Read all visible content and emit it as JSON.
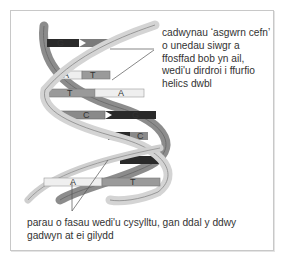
{
  "diagram": {
    "labels": {
      "backbone": "cadwynau ‘asgwrn cefn’ o unedau siwgr a ffosffad bob yn ail, wedi'u dirdroi i ffurfio helics dwbl",
      "base_pairs": "parau o fasau wedi'u cysylltu, gan ddal y ddwy gadwyn at ei gilydd"
    },
    "base_pairs": [
      {
        "left": "G",
        "right": "C"
      },
      {
        "left": "A",
        "right": "T"
      },
      {
        "left": "T",
        "right": "A"
      },
      {
        "left": "C",
        "right": "G"
      },
      {
        "left": "G",
        "right": "C"
      },
      {
        "left": "C",
        "right": "G"
      },
      {
        "left": "A",
        "right": "T"
      }
    ],
    "colors": {
      "strand_light": "#d4d4d4",
      "strand_mid": "#8c8c8c",
      "strand_dark": "#5a5a5a",
      "base_A": "#efefef",
      "base_T": "#9a9a9a",
      "base_C": "#7a7a7a",
      "base_G": "#2a2a2a",
      "frame": "#c8c8c8",
      "text": "#333333"
    }
  }
}
